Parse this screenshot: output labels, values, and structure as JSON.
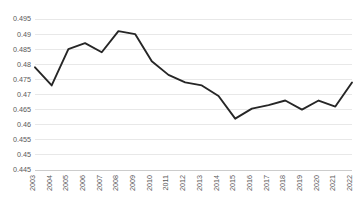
{
  "chart_data": {
    "type": "line",
    "title": "",
    "subtitle": "",
    "xlabel": "",
    "ylabel": "",
    "categories": [
      "2003",
      "2004",
      "2005",
      "2006",
      "2007",
      "2008",
      "2009",
      "2010",
      "2011",
      "2012",
      "2013",
      "2014",
      "2015",
      "2016",
      "2017",
      "2018",
      "2019",
      "2020",
      "2021",
      "2022"
    ],
    "series": [
      {
        "name": "",
        "values": [
          0.479,
          0.473,
          0.485,
          0.487,
          0.484,
          0.491,
          0.49,
          0.481,
          0.4765,
          0.474,
          0.473,
          0.4695,
          0.462,
          0.4653,
          0.4665,
          0.468,
          0.465,
          0.468,
          0.466,
          0.474
        ]
      }
    ],
    "ylim": [
      0.445,
      0.495
    ],
    "yticks": [
      0.445,
      0.45,
      0.455,
      0.46,
      0.465,
      0.47,
      0.475,
      0.48,
      0.485,
      0.49,
      0.495
    ],
    "ytick_labels": [
      "0.445",
      "0.45",
      "0.455",
      "0.46",
      "0.465",
      "0.47",
      "0.475",
      "0.48",
      "0.485",
      "0.49",
      "0.495"
    ],
    "grid": true,
    "grid_axis": "y",
    "legend": false,
    "legend_position": "none",
    "markers": false,
    "line_color": "#262626",
    "grid_color": "#d9d9d9",
    "axis_color": "#bfbfbf",
    "tick_label_color": "#595959",
    "background_color": "#ffffff",
    "xtick_rotation": -90
  },
  "layout": {
    "plot_left": 35,
    "plot_right": 352,
    "plot_top": 19,
    "plot_bottom": 170
  }
}
